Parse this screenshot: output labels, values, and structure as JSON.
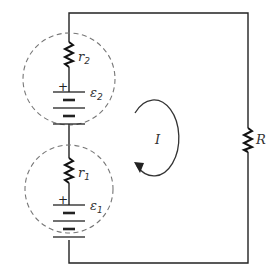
{
  "diagram": {
    "type": "circuit",
    "components": {
      "r2": {
        "symbol": "r",
        "subscript": "2"
      },
      "emf2": {
        "symbol": "ε",
        "subscript": "2",
        "polarity": "+"
      },
      "r1": {
        "symbol": "r",
        "subscript": "1"
      },
      "emf1": {
        "symbol": "ε",
        "subscript": "1",
        "polarity": "+"
      },
      "R": {
        "symbol": "R"
      },
      "current": {
        "symbol": "I",
        "direction": "clockwise"
      }
    },
    "colors": {
      "wire": "#222222",
      "dashed_circle": "#777777",
      "text": "#333333"
    }
  }
}
